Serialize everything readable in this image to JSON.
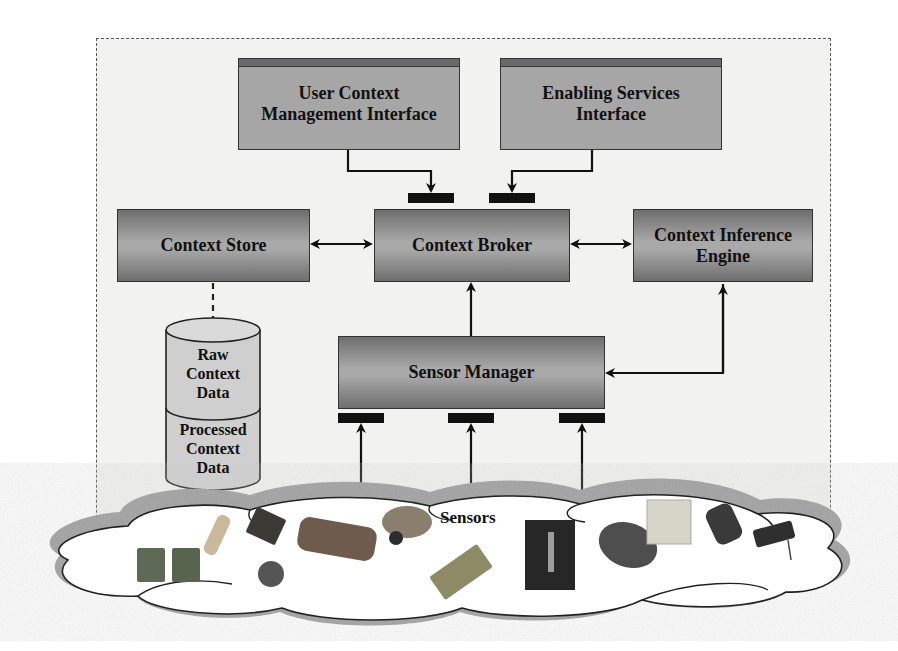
{
  "diagram": {
    "title": "",
    "nodes": {
      "user_context_interface": {
        "line1": "User Context",
        "line2": "Management Interface"
      },
      "enabling_services_interface": {
        "line1": "Enabling Services",
        "line2": "Interface"
      },
      "context_store": {
        "label": "Context Store"
      },
      "context_broker": {
        "label": "Context Broker"
      },
      "context_inference_engine": {
        "line1": "Context Inference",
        "line2": "Engine"
      },
      "sensor_manager": {
        "label": "Sensor Manager"
      },
      "raw_context_data": {
        "line1": "Raw",
        "line2": "Context",
        "line3": "Data"
      },
      "processed_context_data": {
        "line1": "Processed",
        "line2": "Context",
        "line3": "Data"
      },
      "sensors": {
        "label": "Sensors"
      }
    },
    "edges": [
      {
        "from": "User Context Management Interface",
        "to": "Context Broker",
        "type": "arrow"
      },
      {
        "from": "Enabling Services Interface",
        "to": "Context Broker",
        "type": "arrow"
      },
      {
        "from": "Context Store",
        "to": "Context Broker",
        "type": "bidirectional"
      },
      {
        "from": "Context Broker",
        "to": "Context Inference Engine",
        "type": "bidirectional"
      },
      {
        "from": "Sensor Manager",
        "to": "Context Broker",
        "type": "arrow"
      },
      {
        "from": "Sensor Manager",
        "to": "Context Inference Engine",
        "type": "arrow"
      },
      {
        "from": "Sensors",
        "to": "Sensor Manager",
        "type": "arrow",
        "count": 3
      },
      {
        "from": "Context Store",
        "to": "Data Store",
        "type": "dashed"
      }
    ],
    "colors": {
      "box_fill": "#a6a6a6",
      "box_dark": "#6e6e6e",
      "connector": "#111111",
      "frame_border": "#555555",
      "frame_fill": "#f2f2f0",
      "cloud_fill": "#ffffff",
      "cloud_shadow": "#9a9a9a"
    }
  }
}
